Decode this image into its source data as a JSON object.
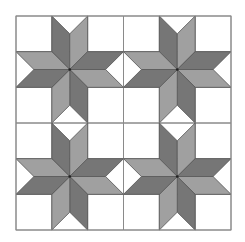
{
  "figure": {
    "grid": {
      "rows": 2,
      "cols": 2
    },
    "block": {
      "cells_per_side": 3
    },
    "origin": {
      "x": 16,
      "y": 16
    },
    "size": {
      "width": 215,
      "height": 214
    },
    "colors": {
      "background": "#ffffff",
      "dark": "#767676",
      "medium": "#a0a0a0",
      "line": "#555555",
      "grid_line": "#8a8a8a"
    },
    "diamonds": [
      {
        "name": "top-left",
        "shade": "dark",
        "pts": [
          [
            1.5,
            1.5
          ],
          [
            1.5,
            0.5
          ],
          [
            1,
            0
          ],
          [
            1,
            1
          ]
        ]
      },
      {
        "name": "top-right",
        "shade": "medium",
        "pts": [
          [
            1.5,
            1.5
          ],
          [
            1.5,
            0.5
          ],
          [
            2,
            0
          ],
          [
            2,
            1
          ]
        ]
      },
      {
        "name": "right-top",
        "shade": "dark",
        "pts": [
          [
            1.5,
            1.5
          ],
          [
            2.5,
            1.5
          ],
          [
            3,
            1
          ],
          [
            2,
            1
          ]
        ]
      },
      {
        "name": "right-bottom",
        "shade": "medium",
        "pts": [
          [
            1.5,
            1.5
          ],
          [
            2.5,
            1.5
          ],
          [
            3,
            2
          ],
          [
            2,
            2
          ]
        ]
      },
      {
        "name": "bottom-right",
        "shade": "dark",
        "pts": [
          [
            1.5,
            1.5
          ],
          [
            1.5,
            2.5
          ],
          [
            2,
            3
          ],
          [
            2,
            2
          ]
        ]
      },
      {
        "name": "bottom-left",
        "shade": "medium",
        "pts": [
          [
            1.5,
            1.5
          ],
          [
            1.5,
            2.5
          ],
          [
            1,
            3
          ],
          [
            1,
            2
          ]
        ]
      },
      {
        "name": "left-bottom",
        "shade": "dark",
        "pts": [
          [
            1.5,
            1.5
          ],
          [
            0.5,
            1.5
          ],
          [
            0,
            2
          ],
          [
            1,
            2
          ]
        ]
      },
      {
        "name": "left-top",
        "shade": "medium",
        "pts": [
          [
            1.5,
            1.5
          ],
          [
            0.5,
            1.5
          ],
          [
            0,
            1
          ],
          [
            1,
            1
          ]
        ]
      }
    ]
  }
}
